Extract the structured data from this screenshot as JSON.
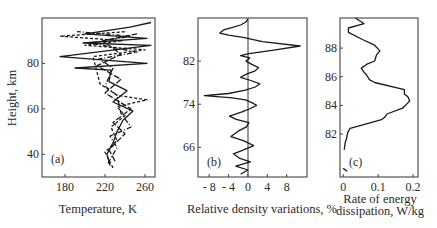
{
  "figure": {
    "panels": [
      "(a)",
      "(b)",
      "(c)"
    ]
  },
  "chart_data": [
    {
      "id": "a",
      "type": "line",
      "panel_label": "(a)",
      "xlabel": "Temperature, K",
      "ylabel": "Height, km",
      "xlim": [
        157,
        270
      ],
      "ylim": [
        30,
        100
      ],
      "xticks": [
        180,
        220,
        260
      ],
      "yticks": [
        40,
        60,
        80
      ],
      "grid": false,
      "orientation": "profile (x = temperature, y = height)",
      "series": [
        {
          "name": "profile-1",
          "style": "solid",
          "points": [
            [
              225,
              35
            ],
            [
              222,
              40
            ],
            [
              228,
              45
            ],
            [
              232,
              50
            ],
            [
              238,
              55
            ],
            [
              248,
              59
            ],
            [
              228,
              63
            ],
            [
              242,
              68
            ],
            [
              224,
              72
            ],
            [
              226,
              77
            ],
            [
              190,
              78
            ],
            [
              262,
              80
            ],
            [
              175,
              83
            ],
            [
              266,
              88
            ],
            [
              198,
              89
            ],
            [
              262,
              91
            ],
            [
              200,
              93
            ],
            [
              245,
              96
            ],
            [
              266,
              98
            ]
          ]
        },
        {
          "name": "profile-2",
          "style": "dashed",
          "points": [
            [
              228,
              34
            ],
            [
              220,
              41
            ],
            [
              232,
              46
            ],
            [
              226,
              52
            ],
            [
              240,
              57
            ],
            [
              232,
              61
            ],
            [
              262,
              64
            ],
            [
              232,
              66
            ],
            [
              215,
              71
            ],
            [
              208,
              83
            ],
            [
              260,
              86
            ],
            [
              200,
              88
            ],
            [
              238,
              90
            ],
            [
              175,
              92
            ],
            [
              242,
              94
            ]
          ]
        },
        {
          "name": "profile-3",
          "style": "dash-dot",
          "points": [
            [
              223,
              36
            ],
            [
              232,
              43
            ],
            [
              225,
              48
            ],
            [
              246,
              52
            ],
            [
              236,
              58
            ],
            [
              232,
              66
            ],
            [
              220,
              70
            ],
            [
              228,
              78
            ],
            [
              214,
              82
            ],
            [
              252,
              85
            ],
            [
              205,
              89
            ],
            [
              246,
              92
            ],
            [
              192,
              94
            ]
          ]
        },
        {
          "name": "profile-4",
          "style": "long-dash",
          "points": [
            [
              230,
              37
            ],
            [
              224,
              42
            ],
            [
              240,
              49
            ],
            [
              228,
              54
            ],
            [
              246,
              60
            ],
            [
              220,
              67
            ],
            [
              236,
              73
            ],
            [
              212,
              79
            ],
            [
              236,
              84
            ],
            [
              218,
              90
            ],
            [
              252,
              93
            ]
          ]
        }
      ]
    },
    {
      "id": "b",
      "type": "line",
      "panel_label": "(b)",
      "xlabel": "Relative density variations, %",
      "ylabel": "",
      "xlim": [
        -10.3,
        12.2
      ],
      "ylim": [
        60.5,
        90
      ],
      "xticks": [
        -8,
        -4,
        0,
        4,
        8
      ],
      "xtick_labels": [
        "- 8",
        "- 4",
        "0",
        "4",
        "8"
      ],
      "yticks": [
        66,
        74,
        82
      ],
      "grid": false,
      "reference_line": {
        "x": 0
      },
      "series": [
        {
          "name": "density-variation",
          "style": "solid",
          "points": [
            [
              -1.5,
              61
            ],
            [
              0,
              61.8
            ],
            [
              -2.5,
              62.5
            ],
            [
              0.5,
              63.3
            ],
            [
              -1.8,
              64
            ],
            [
              -3,
              64.8
            ],
            [
              -1,
              65.5
            ],
            [
              1.2,
              66.3
            ],
            [
              -0.8,
              67.2
            ],
            [
              -3.5,
              68
            ],
            [
              -2,
              69
            ],
            [
              -0.3,
              69.8
            ],
            [
              0.2,
              70.6
            ],
            [
              -2.4,
              71.2
            ],
            [
              -3.8,
              71.8
            ],
            [
              -1.2,
              72.6
            ],
            [
              0.5,
              73.2
            ],
            [
              1.8,
              73.8
            ],
            [
              0.8,
              74.3
            ],
            [
              -0.5,
              74.8
            ],
            [
              -3.2,
              75.2
            ],
            [
              -9,
              75.6
            ],
            [
              -4,
              76
            ],
            [
              -0.5,
              76.6
            ],
            [
              1.5,
              77.2
            ],
            [
              2.5,
              77.8
            ],
            [
              0.6,
              78.4
            ],
            [
              -1.5,
              79
            ],
            [
              -0.3,
              79.6
            ],
            [
              1.5,
              80.2
            ],
            [
              2.2,
              80.8
            ],
            [
              0.8,
              81.4
            ],
            [
              -0.4,
              82
            ],
            [
              0.4,
              82.6
            ],
            [
              -1.5,
              83
            ],
            [
              0.2,
              83.4
            ],
            [
              5,
              84
            ],
            [
              10.8,
              84.8
            ],
            [
              3,
              85.6
            ],
            [
              -1,
              86.4
            ],
            [
              -4,
              86.8
            ],
            [
              -5.8,
              87.2
            ],
            [
              -5,
              87.8
            ],
            [
              -3,
              88.3
            ],
            [
              -1.5,
              88.7
            ],
            [
              -0.5,
              89.2
            ],
            [
              0,
              89.8
            ]
          ]
        }
      ]
    },
    {
      "id": "c",
      "type": "line",
      "panel_label": "(c)",
      "xlabel": "Rate of energy dissipation, W/kg",
      "ylabel": "",
      "xlim": [
        -0.009,
        0.214
      ],
      "ylim": [
        79,
        90.1
      ],
      "xticks": [
        0,
        0.1,
        0.2
      ],
      "yticks": [
        82,
        84,
        86,
        88
      ],
      "grid": false,
      "series": [
        {
          "name": "dissipation-rate",
          "style": "solid",
          "points": [
            [
              0.003,
              80.9
            ],
            [
              0.006,
              81.4
            ],
            [
              0.01,
              81.7
            ],
            [
              0.013,
              82.1
            ],
            [
              0.02,
              82.4
            ],
            [
              0.11,
              83.0
            ],
            [
              0.12,
              83.2
            ],
            [
              0.125,
              83.4
            ],
            [
              0.17,
              83.8
            ],
            [
              0.19,
              84.3
            ],
            [
              0.185,
              84.6
            ],
            [
              0.175,
              84.8
            ],
            [
              0.175,
              85.1
            ],
            [
              0.09,
              85.6
            ],
            [
              0.075,
              85.8
            ],
            [
              0.065,
              86.2
            ],
            [
              0.06,
              86.3
            ],
            [
              0.052,
              86.6
            ],
            [
              0.07,
              86.9
            ],
            [
              0.09,
              87.1
            ],
            [
              0.095,
              87.5
            ],
            [
              0.105,
              87.8
            ],
            [
              0.09,
              88.2
            ],
            [
              0.055,
              88.6
            ],
            [
              0.015,
              89.1
            ],
            [
              0.015,
              89.4
            ],
            [
              0.06,
              89.7
            ],
            [
              0.035,
              90.1
            ]
          ]
        },
        {
          "name": "dissipation-rate-lower-segment",
          "style": "solid",
          "points": [
            [
              0.0,
              79.6
            ],
            [
              0.012,
              79.4
            ]
          ]
        }
      ]
    }
  ]
}
